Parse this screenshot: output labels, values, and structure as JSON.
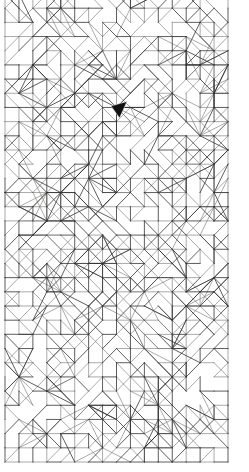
{
  "canvas": {
    "width": 249,
    "height": 472,
    "background": "#ffffff"
  },
  "figure": {
    "kind": "triangulated-grid-mesh",
    "bounds": {
      "x": 5,
      "y": -6,
      "width": 223,
      "height": 468
    },
    "grid": {
      "columns": 16,
      "rows": 33,
      "cell_width": 13.94,
      "cell_height": 14.18
    },
    "stroke_light_color": "#70706f",
    "stroke_dark_color": "#343434",
    "stroke_light_width": 0.6,
    "stroke_dark_width": 0.8,
    "fill_color": "#ffffff",
    "seed": 1337421,
    "hub_count": 96,
    "probabilities": {
      "horizontal_edge": 0.56,
      "vertical_edge": 0.56,
      "diag_main": 0.3,
      "diag_anti": 0.3,
      "diag_both": 0.2,
      "dark_share": 0.45
    },
    "border": {
      "left": 5,
      "right": 228,
      "bottom": 462,
      "top_cut_off": true
    }
  },
  "cursor": {
    "icon": "mouse-pointer-icon",
    "x": 111,
    "y": 101,
    "points": "111,106 127,101.5 119.5,118",
    "fill": "#121212",
    "outline": "#f2f2f2",
    "outline_width": 0.5
  }
}
